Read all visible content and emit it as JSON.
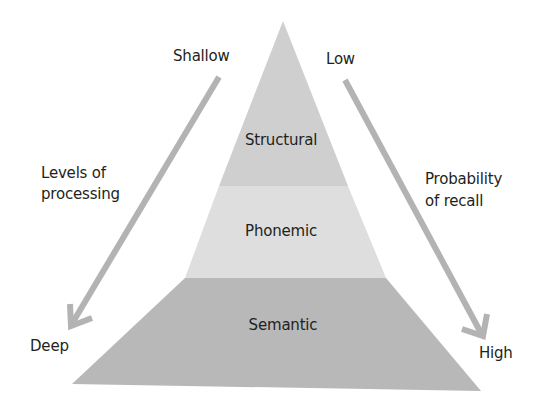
{
  "diagram": {
    "type": "pyramid",
    "layers": [
      {
        "label": "Structural",
        "color": "#cfcfcf"
      },
      {
        "label": "Phonemic",
        "color": "#dedede"
      },
      {
        "label": "Semantic",
        "color": "#b8b8b8"
      }
    ],
    "left_axis": {
      "top_label": "Shallow",
      "bottom_label": "Deep",
      "title_line1": "Levels of",
      "title_line2": "processing",
      "direction": "down"
    },
    "right_axis": {
      "top_label": "Low",
      "bottom_label": "High",
      "title_line1": "Probability",
      "title_line2": "of recall",
      "direction": "down"
    },
    "colors": {
      "arrow": "#b3b3b3",
      "text": "#231f20",
      "background": "#ffffff"
    }
  }
}
